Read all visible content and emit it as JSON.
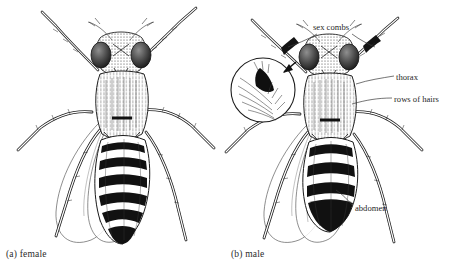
{
  "figure": {
    "background_color": "#ffffff",
    "ink_color": "#1a1a1a",
    "panels": [
      {
        "id": "a",
        "caption": "(a) female",
        "sex": "female",
        "abdomen_bands": 6,
        "abdomen_tip": "pointed",
        "sex_combs": false
      },
      {
        "id": "b",
        "caption": "(b) male",
        "sex": "male",
        "abdomen_bands": 4,
        "abdomen_tip": "rounded-solid-black",
        "sex_combs": true
      }
    ],
    "labels": [
      {
        "key": "sex_combs",
        "text": "sex combs",
        "target": "male front legs (both)"
      },
      {
        "key": "thorax",
        "text": "thorax",
        "target": "male thorax"
      },
      {
        "key": "rows_of_hairs",
        "text": "rows of hairs",
        "target": "male thorax hair rows"
      },
      {
        "key": "abdomen",
        "text": "abdomen",
        "target": "male abdomen"
      }
    ],
    "inset": {
      "shape": "circle",
      "content": "magnified sex comb bristles",
      "arrow": "black arrow pointing from male foreleg into circle"
    }
  }
}
